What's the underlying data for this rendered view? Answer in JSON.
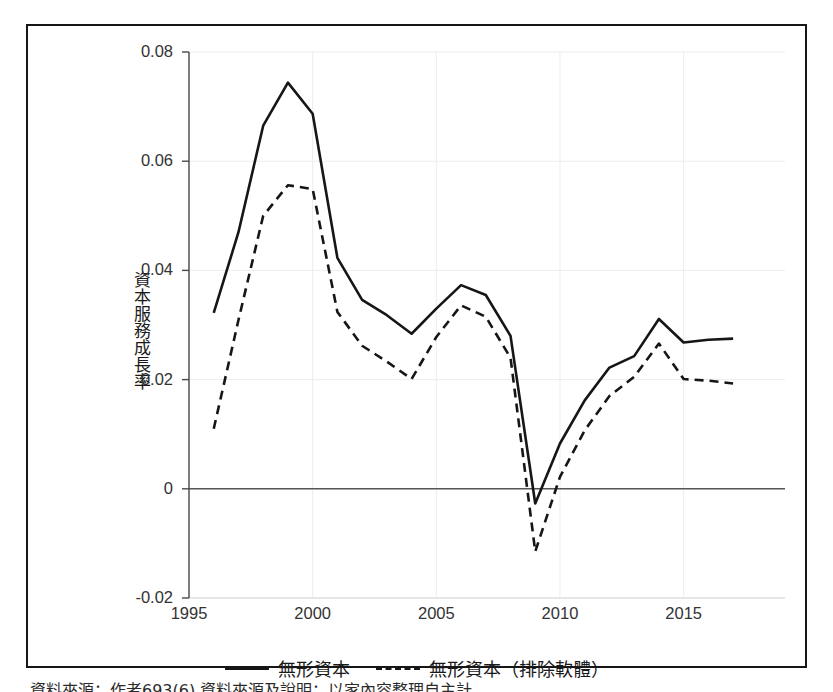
{
  "figure": {
    "border_color": "#161616",
    "background": "#ffffff"
  },
  "axis": {
    "y_title": "資本服務成長率",
    "y_ticks": [
      "0.08",
      "0.06",
      "0.04",
      "0.02",
      "0",
      "-0.02"
    ],
    "x_ticks": [
      "1995",
      "2000",
      "2005",
      "2010",
      "2015"
    ]
  },
  "legend": {
    "items": [
      {
        "label": "無形資本",
        "style": "solid"
      },
      {
        "label": "無形資本（排除軟體）",
        "style": "dashed"
      }
    ]
  },
  "caption": {
    "partial_text": "資料來源：作者693(6)  資料來源及說明：以家內容整理自主計"
  },
  "chart_data": {
    "type": "line",
    "title": "",
    "xlabel": "",
    "ylabel": "資本服務成長率",
    "xlim": [
      1995,
      2017.4
    ],
    "ylim": [
      -0.02,
      0.08
    ],
    "grid": true,
    "grid_color": "#ededed",
    "zero_line": 0,
    "legend_position": "bottom",
    "x": [
      1996,
      1997,
      1998,
      1999,
      2000,
      2001,
      2002,
      2003,
      2004,
      2005,
      2006,
      2007,
      2008,
      2009,
      2010,
      2011,
      2012,
      2013,
      2014,
      2015,
      2016,
      2017
    ],
    "series": [
      {
        "name": "無形資本",
        "style": "solid",
        "color": "#161616",
        "values": [
          0.0322,
          0.047,
          0.0665,
          0.0744,
          0.0687,
          0.0423,
          0.0346,
          0.0318,
          0.0284,
          0.033,
          0.0373,
          0.0355,
          0.028,
          -0.0027,
          0.0083,
          0.0162,
          0.0222,
          0.0243,
          0.0311,
          0.0268,
          0.0273,
          0.0275
        ]
      },
      {
        "name": "無形資本（排除軟體）",
        "style": "dashed",
        "color": "#161616",
        "values": [
          0.011,
          0.0309,
          0.05,
          0.0556,
          0.0549,
          0.0324,
          0.0262,
          0.0233,
          0.0201,
          0.0278,
          0.0336,
          0.0315,
          0.024,
          -0.0115,
          0.0022,
          0.0107,
          0.017,
          0.0205,
          0.0266,
          0.0201,
          0.0198,
          0.0193
        ]
      }
    ]
  }
}
